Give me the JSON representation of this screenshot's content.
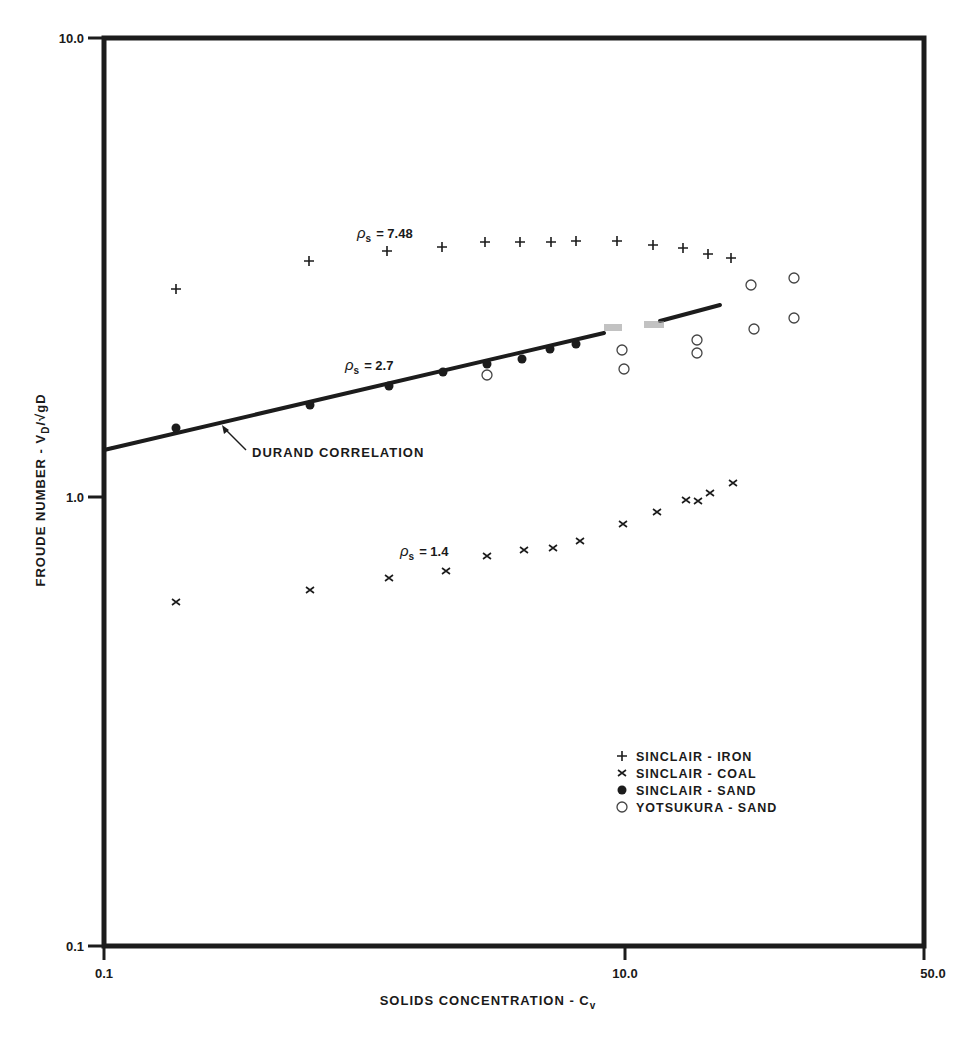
{
  "chart_data": {
    "type": "scatter",
    "title": "",
    "xlabel": "SOLIDS CONCENTRATION - C",
    "xlabel_sub": "v",
    "ylabel": "FROUDE NUMBER - V",
    "ylabel_sub": "D",
    "ylabel_rest": "/√gD",
    "x_scale": "log",
    "y_scale": "log",
    "xlim": [
      0.1,
      50.0
    ],
    "ylim": [
      0.1,
      10.0
    ],
    "x_ticks": [
      {
        "value": 0.1,
        "label": "0.1",
        "px": 104
      },
      {
        "value": 10.0,
        "label": "10.0",
        "px": 625
      },
      {
        "value": 50.0,
        "label": "50.0",
        "px": 924
      }
    ],
    "y_ticks": [
      {
        "value": 10.0,
        "label": "10.0",
        "py": 38
      },
      {
        "value": 1.0,
        "label": "1.0",
        "py": 497
      },
      {
        "value": 0.1,
        "label": "0.1",
        "py": 946
      }
    ],
    "grid": false,
    "legend_position": "lower-right inside",
    "legend": [
      {
        "marker": "plus",
        "symbol": "+",
        "label": "SINCLAIR  -  IRON"
      },
      {
        "marker": "cross",
        "symbol": "×",
        "label": "SINCLAIR  -  COAL"
      },
      {
        "marker": "dot",
        "symbol": "●",
        "label": "SINCLAIR  -  SAND"
      },
      {
        "marker": "circle",
        "symbol": "○",
        "label": "YOTSUKURA  -  SAND"
      }
    ],
    "annotations": [
      {
        "text": "ρs = 7.48",
        "rho": "ρ",
        "sub": "s",
        "value": "= 7.48",
        "px": 357,
        "py": 238
      },
      {
        "text": "ρs = 2.7",
        "rho": "ρ",
        "sub": "s",
        "value": "= 2.7",
        "px": 345,
        "py": 370
      },
      {
        "text": "ρs = 1.4",
        "rho": "ρ",
        "sub": "s",
        "value": "= 1.4",
        "px": 400,
        "py": 556
      },
      {
        "text": "DURAND CORRELATION",
        "px": 252,
        "py": 457,
        "arrow_to": [
          222,
          425
        ],
        "arrow_from": [
          246,
          450
        ]
      }
    ],
    "lines": [
      {
        "name": "DURAND CORRELATION",
        "x": [
          0.1,
          18.0
        ],
        "y": [
          1.28,
          2.6
        ],
        "px_segments": [
          [
            [
              104,
              450
            ],
            [
              604,
              333
            ]
          ],
          [
            [
              660,
              321
            ],
            [
              720,
              305
            ]
          ]
        ]
      }
    ],
    "series": [
      {
        "name": "SINCLAIR - IRON",
        "marker": "plus",
        "x": [
          0.2,
          0.65,
          1.3,
          2.1,
          3.1,
          4.2,
          5.5,
          6.9,
          9.8,
          13.5,
          17.5,
          21.5,
          26.5
        ],
        "y": [
          2.9,
          3.4,
          3.6,
          3.7,
          3.8,
          3.8,
          3.8,
          3.8,
          3.8,
          3.7,
          3.65,
          3.5,
          3.45
        ],
        "px": [
          [
            176,
            289
          ],
          [
            309,
            261
          ],
          [
            387,
            251
          ],
          [
            442,
            247
          ],
          [
            485,
            242
          ],
          [
            520,
            242
          ],
          [
            551,
            242
          ],
          [
            576,
            241
          ],
          [
            617,
            241
          ],
          [
            653,
            245
          ],
          [
            683,
            248
          ],
          [
            708,
            254
          ],
          [
            731,
            258
          ]
        ]
      },
      {
        "name": "SINCLAIR - COAL",
        "marker": "cross",
        "x": [
          0.2,
          0.65,
          1.35,
          2.2,
          3.2,
          4.4,
          5.7,
          7.3,
          10.5,
          14.0,
          18.0,
          20.5,
          22.5,
          27.5
        ],
        "y": [
          0.59,
          0.62,
          0.66,
          0.69,
          0.74,
          0.76,
          0.77,
          0.8,
          0.87,
          0.93,
          0.99,
          0.98,
          1.02,
          1.07
        ],
        "px": [
          [
            176,
            602
          ],
          [
            310,
            590
          ],
          [
            389,
            578
          ],
          [
            446,
            571
          ],
          [
            487,
            556
          ],
          [
            524,
            550
          ],
          [
            553,
            548
          ],
          [
            580,
            541
          ],
          [
            623,
            524
          ],
          [
            657,
            512
          ],
          [
            686,
            500
          ],
          [
            698,
            501
          ],
          [
            710,
            493
          ],
          [
            733,
            483
          ]
        ]
      },
      {
        "name": "SINCLAIR - SAND",
        "marker": "dot",
        "x": [
          0.2,
          0.65,
          1.35,
          2.1,
          3.2,
          4.2,
          5.4,
          6.9
        ],
        "y": [
          1.45,
          1.6,
          1.8,
          1.95,
          2.0,
          2.05,
          2.15,
          2.2
        ],
        "px": [
          [
            176,
            428
          ],
          [
            310,
            405
          ],
          [
            389,
            386
          ],
          [
            443,
            372
          ],
          [
            487,
            364
          ],
          [
            522,
            359
          ],
          [
            550,
            349
          ],
          [
            576,
            344
          ]
        ]
      },
      {
        "name": "YOTSUKURA - SAND",
        "marker": "circle",
        "x": [
          3.2,
          10.0,
          10.1,
          18.5,
          18.5,
          30.0,
          44.0,
          31.0,
          44.0
        ],
        "y": [
          1.9,
          2.15,
          1.95,
          2.25,
          2.1,
          3.0,
          3.1,
          2.4,
          2.45
        ],
        "px": [
          [
            487,
            375
          ],
          [
            622,
            350
          ],
          [
            624,
            369
          ],
          [
            697,
            340
          ],
          [
            697,
            353
          ],
          [
            751,
            285
          ],
          [
            794,
            278
          ],
          [
            754,
            329
          ],
          [
            794,
            318
          ]
        ]
      }
    ]
  }
}
